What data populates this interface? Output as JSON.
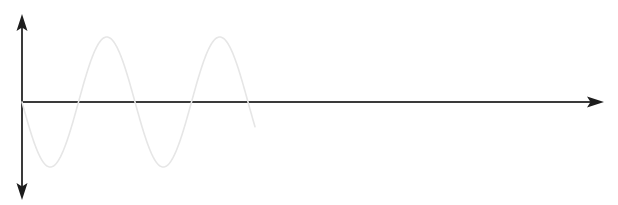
{
  "figure": {
    "background_color": "#ffffff",
    "width": 618,
    "height": 205
  },
  "axes": {
    "origin": {
      "x": 22,
      "y": 102
    },
    "color": "#3a3a3a",
    "arrow_color": "#1d1d1d",
    "stroke_width": 2,
    "vertical": {
      "name": "y-axis",
      "label": "",
      "x": 22,
      "top_y": 17,
      "bottom_y": 196,
      "arrow_heads": [
        "up",
        "down"
      ]
    },
    "horizontal": {
      "name": "x-axis",
      "label": "",
      "y": 102,
      "left_x": 22,
      "right_x": 600,
      "arrow_heads": [
        "right"
      ]
    },
    "tick_labels": [],
    "grid": false
  },
  "watermark": {
    "line1": "",
    "line2": "",
    "color": "#f4f4f4"
  },
  "chart_data": {
    "type": "line",
    "title": "",
    "subtitle": "",
    "xlabel": "",
    "ylabel": "",
    "legend": [],
    "legend_position": "none",
    "grid": false,
    "xlim": [
      0,
      600
    ],
    "ylim": [
      -1.1,
      1.1
    ],
    "series": [
      {
        "name": "sine-wave",
        "color": "#e6e6e6",
        "stroke_width": 1.6,
        "description": "Negative-going sine, two full cycles then truncated at the axis",
        "form": "y = -A*sin(2*pi*x/T)",
        "amplitude_px": 65,
        "period_px": 113,
        "phase": "starts at origin descending",
        "cycles": 2,
        "start_x": 22,
        "end_x": 255,
        "x": [
          22,
          52,
          82,
          110,
          137,
          165,
          194,
          222,
          255
        ],
        "y": [
          0,
          -1,
          0,
          1,
          0,
          -1,
          0,
          1,
          0
        ],
        "key_points": [
          {
            "label": "origin",
            "x": 22,
            "y": 0
          },
          {
            "label": "trough-1",
            "x": 52,
            "y": -1
          },
          {
            "label": "zero-crossing-1",
            "x": 82,
            "y": 0
          },
          {
            "label": "peak-1",
            "x": 110,
            "y": 1
          },
          {
            "label": "zero-crossing-2",
            "x": 137,
            "y": 0
          },
          {
            "label": "trough-2",
            "x": 165,
            "y": -1
          },
          {
            "label": "zero-crossing-3",
            "x": 194,
            "y": 0
          },
          {
            "label": "peak-2",
            "x": 222,
            "y": 1
          },
          {
            "label": "end",
            "x": 255,
            "y": 0
          }
        ]
      }
    ]
  }
}
